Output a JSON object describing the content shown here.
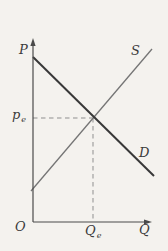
{
  "figure": {
    "width_px": 168,
    "height_px": 251,
    "background_color": "#f4f2ee",
    "description_labels_visible": [
      "P",
      "S",
      "p",
      "e",
      "D",
      "O",
      "Q",
      "Qe"
    ]
  },
  "chart_data": {
    "type": "line",
    "subtype": "supply-demand-diagram",
    "title": "",
    "grid": false,
    "legend": null,
    "axes": {
      "y_label": "P",
      "x_label": "Q",
      "origin_label": "O",
      "color": "#4a4a4a",
      "width": 1.2,
      "origin_px": [
        33,
        222
      ],
      "y_axis_top_px": 38,
      "x_axis_right_px": 152
    },
    "series": [
      {
        "name": "demand",
        "label": "D",
        "slope": "downward",
        "from_px": [
          33,
          57
        ],
        "to_px": [
          154,
          176
        ],
        "color": "#383838",
        "width": 2
      },
      {
        "name": "supply",
        "label": "S",
        "slope": "upward",
        "from_px": [
          31,
          191
        ],
        "to_px": [
          152,
          49
        ],
        "color": "#757575",
        "width": 1.3
      }
    ],
    "equilibrium": {
      "point_px": [
        93,
        118
      ],
      "price_label": {
        "main": "p",
        "sub": "e"
      },
      "quantity_label": {
        "main": "Q",
        "sub": "e"
      },
      "dash_color": "#8f8f8f",
      "dash_width": 1,
      "dash_pattern": [
        4.5,
        3.5
      ]
    }
  }
}
